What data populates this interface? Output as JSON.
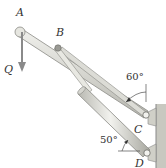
{
  "diagram": {
    "type": "mechanism",
    "points": {
      "A": {
        "label": "A"
      },
      "B": {
        "label": "B"
      },
      "C": {
        "label": "C"
      },
      "D": {
        "label": "D"
      }
    },
    "force": {
      "label": "Q",
      "direction": "down"
    },
    "angles": {
      "C": {
        "label": "60°"
      },
      "D": {
        "label": "50°"
      }
    },
    "colors": {
      "bar_fill": "#d9d9d4",
      "bar_stroke": "#8a8a85",
      "cylinder_fill": "#e2e2dc",
      "force_arrow": "#8a8a8a",
      "wall": "#c8c8c0"
    }
  }
}
